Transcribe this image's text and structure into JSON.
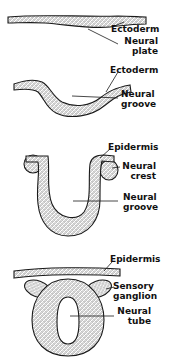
{
  "figure": {
    "stages": [
      {
        "id": "stage-1",
        "labels": [
          "Ectoderm",
          "Neural plate"
        ]
      },
      {
        "id": "stage-2",
        "labels": [
          "Ectoderm",
          "Neural groove"
        ]
      },
      {
        "id": "stage-3",
        "labels": [
          "Epidermis",
          "Neural crest",
          "Neural groove"
        ]
      },
      {
        "id": "stage-4",
        "labels": [
          "Epidermis",
          "Sensory ganglion",
          "Neural tube"
        ]
      }
    ]
  },
  "labels": {
    "s1_ectoderm": "Ectoderm",
    "s1_neural_l1": "Neural",
    "s1_neural_l2": "plate",
    "s2_ectoderm": "Ectoderm",
    "s2_neural_l1": "Neural",
    "s2_neural_l2": "groove",
    "s3_epidermis": "Epidermis",
    "s3_crest_l1": "Neural",
    "s3_crest_l2": "crest",
    "s3_groove_l1": "Neural",
    "s3_groove_l2": "groove",
    "s4_epidermis": "Epidermis",
    "s4_ganglion_l1": "Sensory",
    "s4_ganglion_l2": "ganglion",
    "s4_tube_l1": "Neural",
    "s4_tube_l2": "tube"
  },
  "colors": {
    "ink": "#1a1a1a",
    "background": "#ffffff"
  }
}
